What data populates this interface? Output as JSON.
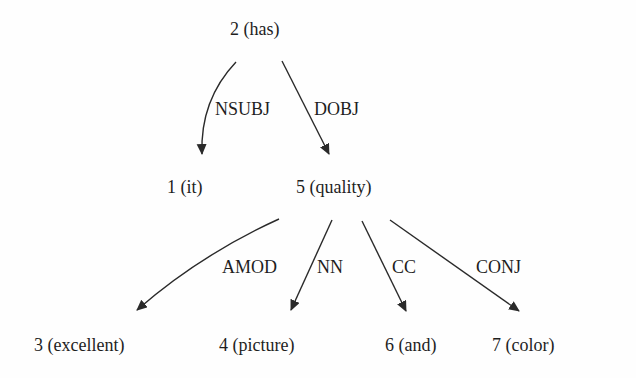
{
  "diagram": {
    "type": "dependency-parse-tree",
    "nodes": [
      {
        "id": 2,
        "text": "2 (has)"
      },
      {
        "id": 1,
        "text": "1 (it)"
      },
      {
        "id": 5,
        "text": "5 (quality)"
      },
      {
        "id": 3,
        "text": "3 (excellent)"
      },
      {
        "id": 4,
        "text": "4 (picture)"
      },
      {
        "id": 6,
        "text": "6 (and)"
      },
      {
        "id": 7,
        "text": "7 (color)"
      }
    ],
    "edges": [
      {
        "from": 2,
        "to": 1,
        "label": "NSUBJ"
      },
      {
        "from": 2,
        "to": 5,
        "label": "DOBJ"
      },
      {
        "from": 5,
        "to": 3,
        "label": "AMOD"
      },
      {
        "from": 5,
        "to": 4,
        "label": "NN"
      },
      {
        "from": 5,
        "to": 6,
        "label": "CC"
      },
      {
        "from": 5,
        "to": 7,
        "label": "CONJ"
      }
    ],
    "colors": {
      "line": "#2a2a2a",
      "text": "#1e1e1e",
      "background": "#fefefe"
    }
  }
}
